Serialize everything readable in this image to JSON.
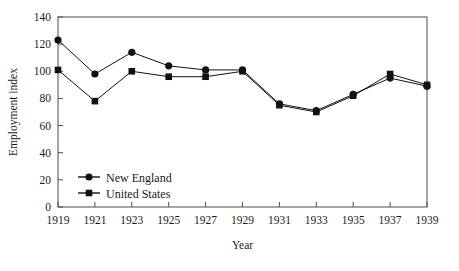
{
  "chart_data": {
    "type": "line",
    "title": "",
    "xlabel": "Year",
    "ylabel": "Employment index",
    "x": [
      1919,
      1921,
      1923,
      1925,
      1927,
      1929,
      1931,
      1933,
      1935,
      1937,
      1939
    ],
    "xtick_labels": [
      "1919",
      "1921",
      "1923",
      "1925",
      "1927",
      "1929",
      "1931",
      "1933",
      "1935",
      "1937",
      "1939"
    ],
    "ytick_labels": [
      "0",
      "20",
      "40",
      "60",
      "80",
      "100",
      "120",
      "140"
    ],
    "yticks": [
      0,
      20,
      40,
      60,
      80,
      100,
      120,
      140
    ],
    "xlim": [
      1919,
      1939
    ],
    "ylim": [
      0,
      140
    ],
    "grid": false,
    "legend_position": "lower-left-inside",
    "series": [
      {
        "name": "New England",
        "marker": "circle",
        "color": "#111111",
        "values": [
          123,
          98,
          114,
          104,
          101,
          101,
          76,
          71,
          83,
          95,
          89
        ]
      },
      {
        "name": "United States",
        "marker": "square",
        "color": "#111111",
        "values": [
          101,
          78,
          100,
          96,
          96,
          100,
          75,
          70,
          82,
          98,
          90
        ]
      }
    ]
  },
  "legend": {
    "items": [
      {
        "label": "New England",
        "marker": "circle"
      },
      {
        "label": "United States",
        "marker": "square"
      }
    ]
  }
}
